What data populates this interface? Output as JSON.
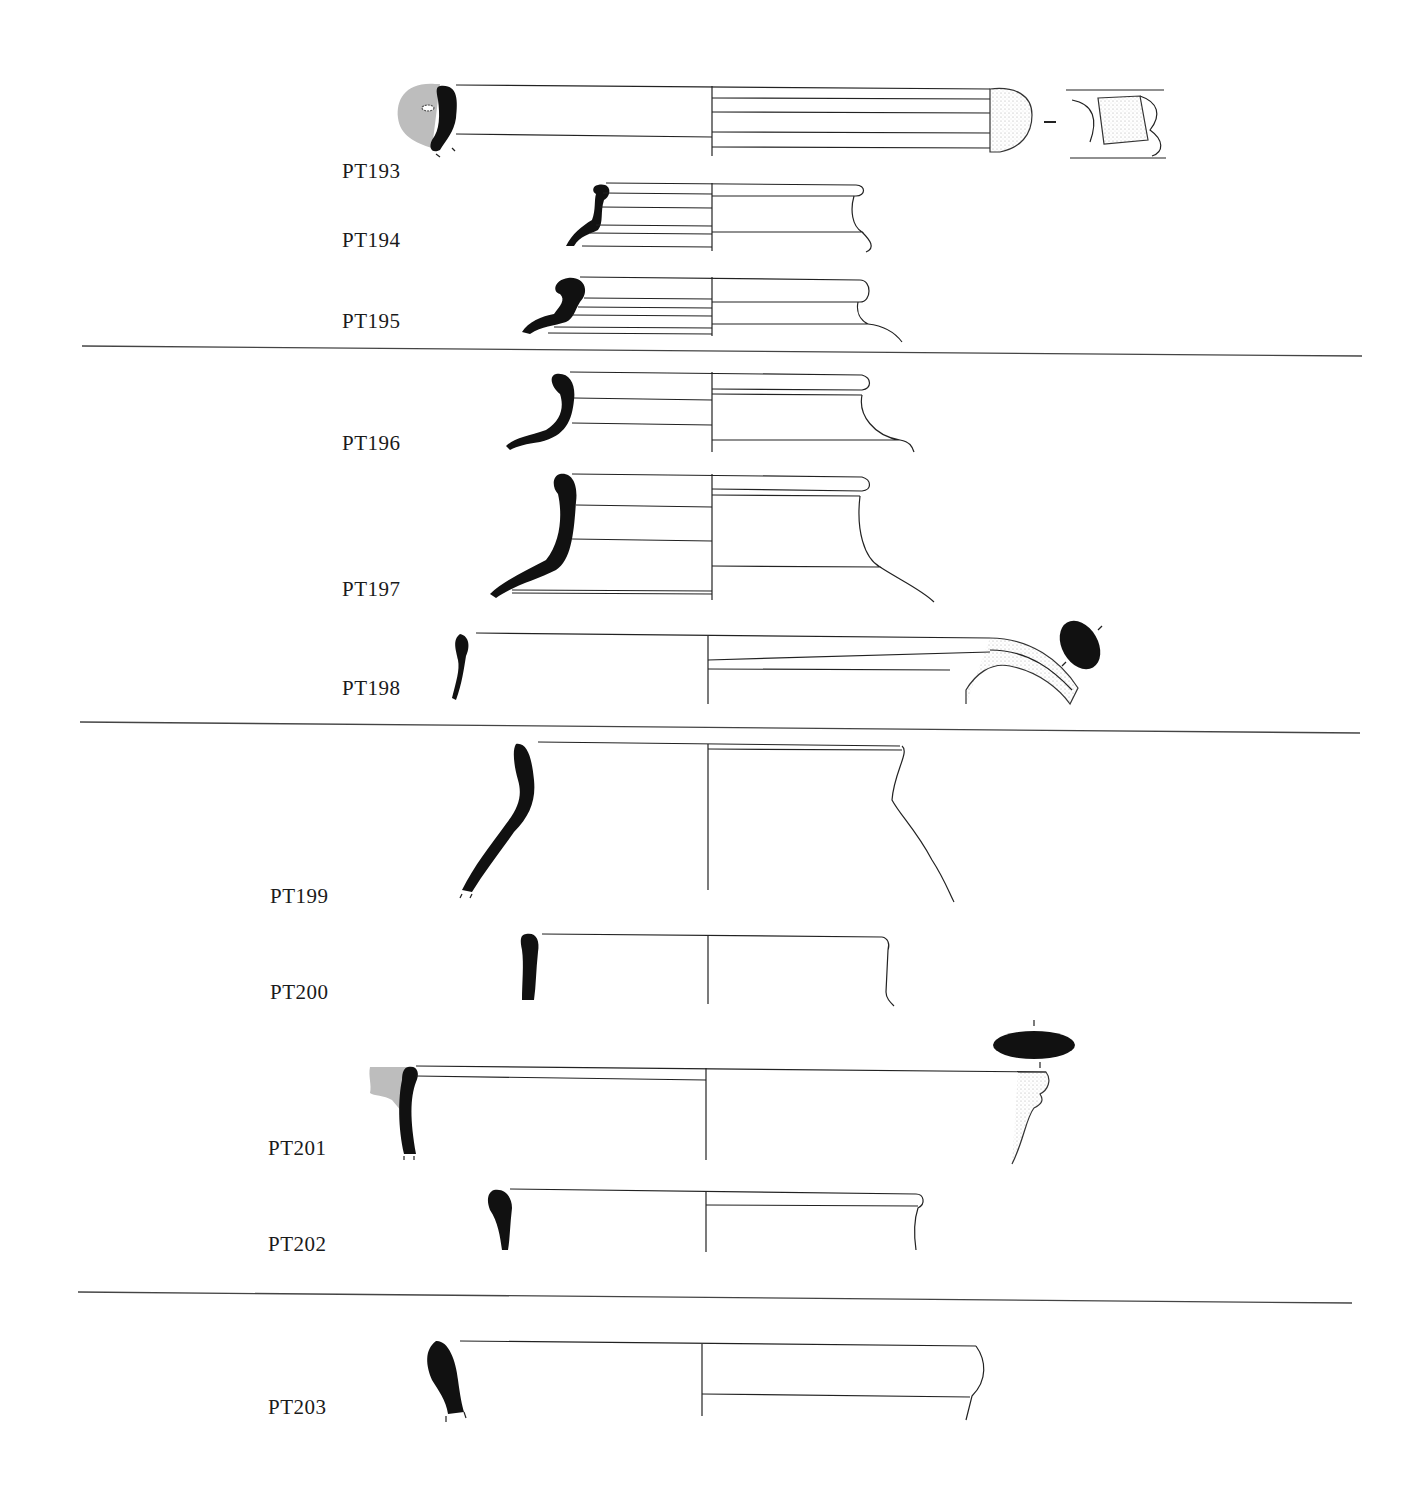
{
  "figure": {
    "type": "pottery profile drawing plate",
    "colors": {
      "section": "#111111",
      "line": "#222222",
      "restored": "#bdbdbd",
      "separator": "#444444"
    }
  },
  "groups": [
    {
      "id": "group-1",
      "items": [
        "PT193",
        "PT194",
        "PT195"
      ]
    },
    {
      "id": "group-2",
      "items": [
        "PT196",
        "PT197",
        "PT198"
      ]
    },
    {
      "id": "group-3",
      "items": [
        "PT199",
        "PT200",
        "PT201",
        "PT202"
      ]
    },
    {
      "id": "group-4",
      "items": [
        "PT203"
      ]
    }
  ],
  "vessels": [
    {
      "label": "PT193",
      "x": 342,
      "y": 182,
      "features": [
        "rim section with grey restoration",
        "handle attachment",
        "handle view"
      ]
    },
    {
      "label": "PT194",
      "x": 342,
      "y": 250
    },
    {
      "label": "PT195",
      "x": 342,
      "y": 331
    },
    {
      "label": "PT196",
      "x": 342,
      "y": 453
    },
    {
      "label": "PT197",
      "x": 342,
      "y": 599
    },
    {
      "label": "PT198",
      "x": 342,
      "y": 698,
      "features": [
        "handle",
        "handle section"
      ]
    },
    {
      "label": "PT199",
      "x": 270,
      "y": 906
    },
    {
      "label": "PT200",
      "x": 270,
      "y": 1002
    },
    {
      "label": "PT201",
      "x": 268,
      "y": 1158,
      "features": [
        "grey restoration",
        "handle section"
      ]
    },
    {
      "label": "PT202",
      "x": 268,
      "y": 1254
    },
    {
      "label": "PT203",
      "x": 268,
      "y": 1417
    }
  ]
}
